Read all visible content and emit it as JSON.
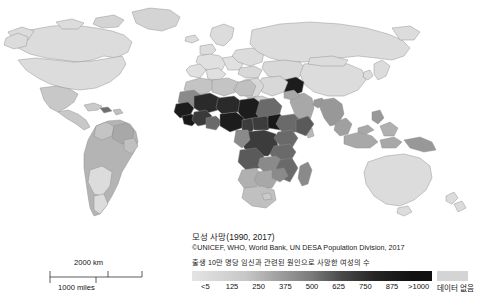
{
  "year_label": "2017",
  "caption": {
    "title": "모성 사망(1990, 2017)",
    "source": "©UNICEF, WHO, World Bank, UN DESA Population Division, 2017"
  },
  "legend": {
    "caption": "출생 10만 명당 임신과 관련된 원인으로 사망한 여성의 수",
    "ticks": [
      "<5",
      "125",
      "250",
      "375",
      "500",
      "625",
      "750",
      "875",
      ">1000"
    ],
    "nodata_label": "데이터 없음",
    "nodata_color": "#d4d4d4",
    "gradient_start_color": "#e4e4e4",
    "gradient_end_color": "#111111"
  },
  "scalebar": {
    "km_label": "2000 km",
    "miles_label": "1000 miles"
  },
  "chart_data": {
    "type": "heatmap",
    "title": "모성 사망(1990, 2017)",
    "subtitle": "©UNICEF, WHO, World Bank, UN DESA Population Division, 2017",
    "xlabel": "",
    "ylabel": "",
    "value_label": "출생 10만 명당 임신과 관련된 원인으로 사망한 여성의 수",
    "unit": "deaths per 100,000 live births",
    "year": "2017",
    "legend_position": "bottom",
    "grid": false,
    "scale_ticks": [
      "<5",
      "125",
      "250",
      "375",
      "500",
      "625",
      "750",
      "875",
      ">1000"
    ],
    "scale_values": [
      5,
      125,
      250,
      375,
      500,
      625,
      750,
      875,
      1000
    ],
    "nodata_category": "데이터 없음",
    "colors": {
      "low": "#e4e4e4",
      "high": "#111111",
      "nodata": "#d4d4d4",
      "border": "#8a8a8a",
      "ocean": "#ffffff"
    },
    "regions": [
      {
        "name": "North America",
        "value": 20,
        "shade": "#dcdcdc"
      },
      {
        "name": "Greenland",
        "value": null,
        "shade": "#d4d4d4"
      },
      {
        "name": "Central America",
        "value": 90,
        "shade": "#c8c8c8"
      },
      {
        "name": "Caribbean (Haiti)",
        "value": 480,
        "shade": "#6e6e6e"
      },
      {
        "name": "South America (north)",
        "value": 150,
        "shade": "#b4b4b4"
      },
      {
        "name": "South America (south)",
        "value": 40,
        "shade": "#dcdcdc"
      },
      {
        "name": "Western Europe",
        "value": 8,
        "shade": "#e0e0e0"
      },
      {
        "name": "Eastern Europe / Russia",
        "value": 20,
        "shade": "#dcdcdc"
      },
      {
        "name": "North Africa",
        "value": 90,
        "shade": "#c4c4c4"
      },
      {
        "name": "Sahel (Mali, Niger, Chad)",
        "value": 850,
        "shade": "#2a2a2a"
      },
      {
        "name": "West Africa (Sierra Leone, Guinea, Nigeria)",
        "value": 950,
        "shade": "#1c1c1c"
      },
      {
        "name": "South Sudan",
        "value": 1000,
        "shade": "#181818"
      },
      {
        "name": "Central Africa (DRC, CAR)",
        "value": 700,
        "shade": "#3c3c3c"
      },
      {
        "name": "East Africa (Ethiopia, Somalia, Kenya)",
        "value": 500,
        "shade": "#6a6a6a"
      },
      {
        "name": "Southern Africa",
        "value": 250,
        "shade": "#a0a0a0"
      },
      {
        "name": "South Africa",
        "value": 120,
        "shade": "#c0c0c0"
      },
      {
        "name": "Madagascar",
        "value": 340,
        "shade": "#8a8a8a"
      },
      {
        "name": "Middle East",
        "value": 40,
        "shade": "#d8d8d8"
      },
      {
        "name": "Afghanistan",
        "value": 640,
        "shade": "#1c1c1c"
      },
      {
        "name": "South Asia (India, Pakistan, Bangladesh)",
        "value": 170,
        "shade": "#a8a8a8"
      },
      {
        "name": "China",
        "value": 30,
        "shade": "#dcdcdc"
      },
      {
        "name": "Southeast Asia (Myanmar, Laos)",
        "value": 250,
        "shade": "#989898"
      },
      {
        "name": "Indonesia",
        "value": 180,
        "shade": "#a8a8a8"
      },
      {
        "name": "Papua New Guinea",
        "value": 150,
        "shade": "#989898"
      },
      {
        "name": "Australia",
        "value": 6,
        "shade": "#dcdcdc"
      },
      {
        "name": "New Zealand",
        "value": 9,
        "shade": "#dcdcdc"
      },
      {
        "name": "Japan / Korea",
        "value": 5,
        "shade": "#dcdcdc"
      }
    ]
  }
}
